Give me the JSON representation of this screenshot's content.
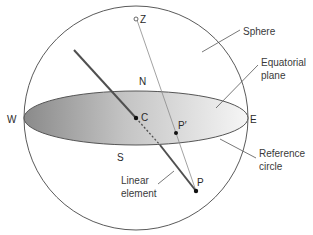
{
  "diagram": {
    "type": "stereographic projection sphere",
    "labels": {
      "sphere": "Sphere",
      "equatorial_plane_line1": "Equatorial",
      "equatorial_plane_line2": "plane",
      "reference_circle_line1": "Reference",
      "reference_circle_line2": "circle",
      "linear_element_line1": "Linear",
      "linear_element_line2": "element"
    },
    "points": {
      "zenith": "Z",
      "north": "N",
      "south": "S",
      "west": "W",
      "east": "E",
      "center": "C",
      "pole": "P",
      "projection": "P′"
    },
    "colors": {
      "outline": "#555555",
      "plane_dark": "#8c8c8c",
      "plane_light": "#f2f2f2",
      "text": "#3a3a3a",
      "linear_element": "#505050"
    }
  }
}
